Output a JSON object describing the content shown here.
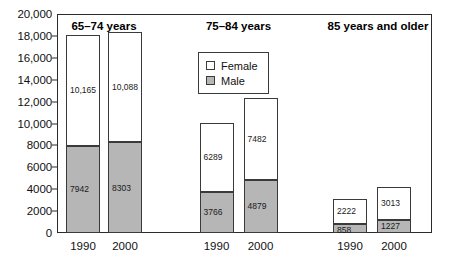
{
  "chart_data": {
    "type": "bar",
    "subtype": "stacked-grouped",
    "title": "",
    "xlabel": "",
    "ylabel": "",
    "ylim": [
      0,
      20000
    ],
    "grid": false,
    "legend_position": "top-center",
    "y_ticks": [
      {
        "value": 0,
        "label": "0"
      },
      {
        "value": 2000,
        "label": "2000"
      },
      {
        "value": 4000,
        "label": "4000"
      },
      {
        "value": 6000,
        "label": "6000"
      },
      {
        "value": 8000,
        "label": "8000"
      },
      {
        "value": 10000,
        "label": "10,000"
      },
      {
        "value": 12000,
        "label": "12,000"
      },
      {
        "value": 14000,
        "label": "14,000"
      },
      {
        "value": 16000,
        "label": "16,000"
      },
      {
        "value": 18000,
        "label": "18,000"
      },
      {
        "value": 20000,
        "label": "20,000"
      }
    ],
    "legend": [
      {
        "name": "Female",
        "swatch": "female",
        "color": "#ffffff"
      },
      {
        "name": "Male",
        "swatch": "male",
        "color": "#b6b6b6"
      }
    ],
    "series": [
      {
        "name": "Male",
        "values": [
          7942,
          8303,
          3766,
          4879,
          858,
          1227
        ]
      },
      {
        "name": "Female",
        "values": [
          10165,
          10088,
          6289,
          7482,
          2222,
          3013
        ]
      }
    ],
    "categories": [
      "1990",
      "2000",
      "1990",
      "2000",
      "1990",
      "2000"
    ],
    "groups": [
      {
        "title": "65–74 years",
        "bars": [
          {
            "year": "1990",
            "male": 7942,
            "female": 10165,
            "male_label": "7942",
            "female_label": "10,165",
            "total": 18107
          },
          {
            "year": "2000",
            "male": 8303,
            "female": 10088,
            "male_label": "8303",
            "female_label": "10,088",
            "total": 18391
          }
        ]
      },
      {
        "title": "75–84 years",
        "bars": [
          {
            "year": "1990",
            "male": 3766,
            "female": 6289,
            "male_label": "3766",
            "female_label": "6289",
            "total": 10055
          },
          {
            "year": "2000",
            "male": 4879,
            "female": 7482,
            "male_label": "4879",
            "female_label": "7482",
            "total": 12361
          }
        ]
      },
      {
        "title": "85 years and older",
        "bars": [
          {
            "year": "1990",
            "male": 858,
            "female": 2222,
            "male_label": "858",
            "female_label": "2222",
            "total": 3080
          },
          {
            "year": "2000",
            "male": 1227,
            "female": 3013,
            "male_label": "1227",
            "female_label": "3013",
            "total": 4240
          }
        ]
      }
    ]
  },
  "colors": {
    "male_fill": "#b6b6b6",
    "female_fill": "#ffffff",
    "stroke": "#3a3a3a",
    "axis": "#2b2b2b",
    "text": "#111111"
  }
}
